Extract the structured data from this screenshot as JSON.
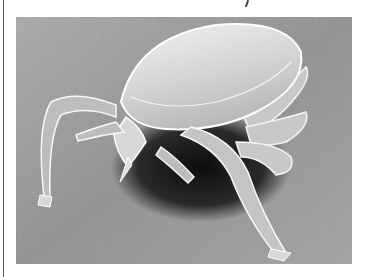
{
  "image": {
    "subject": "scanning electron micrograph of a tick",
    "palette": {
      "background": "#9a9a9a",
      "background_dark": "#5a5a5a",
      "shadow": "#1a1a1a",
      "body_light": "#e6e6e6",
      "body_mid": "#c4c4c4",
      "outline": "#ffffff"
    }
  }
}
